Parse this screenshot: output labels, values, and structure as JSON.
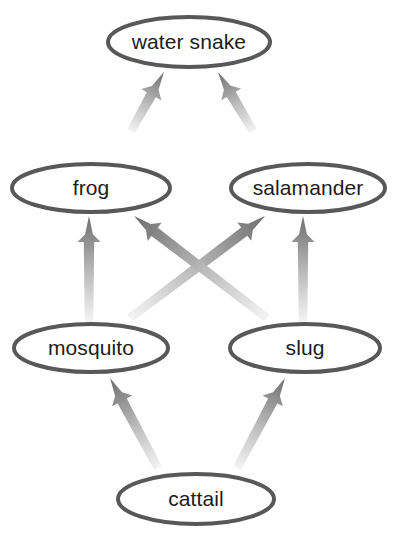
{
  "diagram": {
    "type": "food-web",
    "title": "",
    "background_color": "#ffffff",
    "node_fill": "#ffffff",
    "node_border_color": "#585858",
    "arrow_head_color": "#6e6e6e",
    "arrow_tail_color": "#e8e8e8",
    "nodes": [
      {
        "id": "water-snake",
        "label": "water snake",
        "tier": 0,
        "cx": 189,
        "cy": 42,
        "rx": 81,
        "ry": 25
      },
      {
        "id": "frog",
        "label": "frog",
        "tier": 1,
        "cx": 91,
        "cy": 188,
        "rx": 79,
        "ry": 24
      },
      {
        "id": "salamander",
        "label": "salamander",
        "tier": 1,
        "cx": 308,
        "cy": 188,
        "rx": 77,
        "ry": 24
      },
      {
        "id": "mosquito",
        "label": "mosquito",
        "tier": 2,
        "cx": 91,
        "cy": 348,
        "rx": 77,
        "ry": 24
      },
      {
        "id": "slug",
        "label": "slug",
        "tier": 2,
        "cx": 305,
        "cy": 348,
        "rx": 75,
        "ry": 24
      },
      {
        "id": "cattail",
        "label": "cattail",
        "tier": 3,
        "cx": 196,
        "cy": 499,
        "rx": 78,
        "ry": 25
      }
    ],
    "edges": [
      {
        "id": "frog-to-water-snake",
        "from": "frog",
        "to": "water-snake",
        "x1": 131,
        "y1": 131,
        "x2": 164,
        "y2": 72
      },
      {
        "id": "salamander-to-water-snake",
        "from": "salamander",
        "to": "water-snake",
        "x1": 253,
        "y1": 131,
        "x2": 218,
        "y2": 72
      },
      {
        "id": "mosquito-to-frog",
        "from": "mosquito",
        "to": "frog",
        "x1": 89,
        "y1": 322,
        "x2": 89,
        "y2": 216
      },
      {
        "id": "mosquito-to-salamander",
        "from": "mosquito",
        "to": "salamander",
        "x1": 130,
        "y1": 318,
        "x2": 265,
        "y2": 216
      },
      {
        "id": "slug-to-frog",
        "from": "slug",
        "to": "frog",
        "x1": 267,
        "y1": 318,
        "x2": 134,
        "y2": 216
      },
      {
        "id": "slug-to-salamander",
        "from": "slug",
        "to": "salamander",
        "x1": 303,
        "y1": 322,
        "x2": 303,
        "y2": 216
      },
      {
        "id": "cattail-to-mosquito",
        "from": "cattail",
        "to": "mosquito",
        "x1": 158,
        "y1": 468,
        "x2": 110,
        "y2": 378
      },
      {
        "id": "cattail-to-slug",
        "from": "cattail",
        "to": "slug",
        "x1": 237,
        "y1": 468,
        "x2": 285,
        "y2": 378
      }
    ]
  }
}
